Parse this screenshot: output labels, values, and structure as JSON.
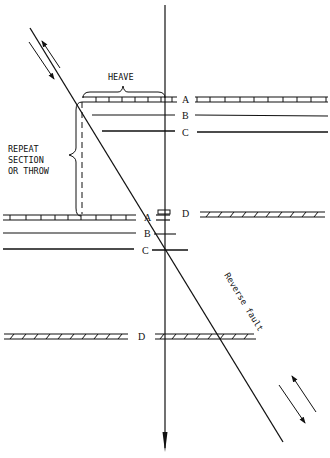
{
  "diagram": {
    "labels": {
      "heave": "HEAVE",
      "repeat_1": "REPEAT",
      "repeat_2": "SECTION",
      "repeat_3": "OR THROW",
      "fault": "Reverse fault"
    },
    "beds": {
      "upper_right": [
        {
          "label": "A",
          "y": 100,
          "style": "ticked-double"
        },
        {
          "label": "B",
          "y": 117,
          "style": "single"
        },
        {
          "label": "C",
          "y": 133,
          "style": "single-bold"
        }
      ],
      "lower_left": [
        {
          "label": "A",
          "y": 217,
          "style": "ticked-double"
        },
        {
          "label": "B",
          "y": 233,
          "style": "single"
        },
        {
          "label": "C",
          "y": 250,
          "style": "single-bold"
        }
      ],
      "d_upper": {
        "label": "D",
        "y": 213,
        "style": "hatched-double"
      },
      "d_lower": {
        "label": "D",
        "y": 336,
        "style": "hatched-double"
      }
    },
    "colors": {
      "ink": "#111111",
      "background": "#ffffff"
    }
  }
}
